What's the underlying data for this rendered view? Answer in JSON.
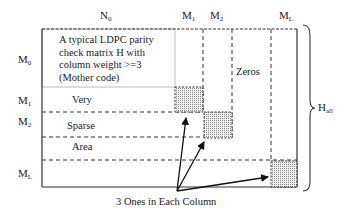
{
  "diagram": {
    "title_text": "A typical LDPC parity check matrix H with column weight >=3 (Mother code)",
    "mother_code_lines": [
      "A typical LDPC parity",
      "check matrix H with",
      "column weight >=3",
      "(Mother code)"
    ],
    "column_labels": [
      {
        "base": "N",
        "sub": "0"
      },
      {
        "base": "M",
        "sub": "1"
      },
      {
        "base": "M",
        "sub": "2"
      },
      {
        "base": "M",
        "sub": "L"
      }
    ],
    "row_labels": [
      {
        "base": "M",
        "sub": "0"
      },
      {
        "base": "M",
        "sub": "1"
      },
      {
        "base": "M",
        "sub": "2"
      },
      {
        "base": "M",
        "sub": "L"
      }
    ],
    "region_words": [
      "Very",
      "Sparse",
      "Area"
    ],
    "zeros_label": "Zeros",
    "brace_label": {
      "base": "H",
      "sub": "all"
    },
    "caption": "3 Ones in Each Column",
    "colors": {
      "line": "#333333",
      "mother_box_border": "#bbbbbb",
      "shade": "#d9d9d9",
      "text": "#222222"
    }
  }
}
